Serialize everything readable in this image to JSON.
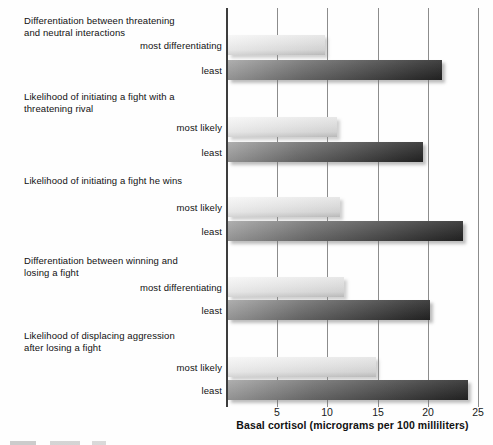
{
  "chart_data": {
    "type": "bar",
    "orientation": "horizontal",
    "title": "",
    "xlabel": "Basal cortisol (micrograms per 100 milliliters)",
    "ylabel": "",
    "xlim": [
      0,
      25
    ],
    "x_ticks": [
      5,
      10,
      15,
      20,
      25
    ],
    "gridlines": "vertical",
    "legend_position": "none",
    "bar_shade_meaning": {
      "light": "most (differentiating / likely)",
      "dark": "least"
    },
    "groups": [
      {
        "id": "a.",
        "label": "Differentiation between threatening and neutral interactions",
        "label_lines": [
          "Differentiation between threatening",
          "and neutral interactions"
        ],
        "bars": [
          {
            "label": "most differentiating",
            "value": 9.8,
            "shade": "light"
          },
          {
            "label": "least",
            "value": 21.4,
            "shade": "dark"
          }
        ]
      },
      {
        "id": "b.",
        "label": "Likelihood of initiating a fight with a threatening rival",
        "label_lines": [
          "Likelihood of initiating a fight with a",
          "threatening rival"
        ],
        "bars": [
          {
            "label": "most likely",
            "value": 11.0,
            "shade": "light"
          },
          {
            "label": "least",
            "value": 19.5,
            "shade": "dark"
          }
        ]
      },
      {
        "id": "c.",
        "label": "Likelihood of initiating a fight he wins",
        "label_lines": [
          "Likelihood of initiating a fight he wins"
        ],
        "bars": [
          {
            "label": "most likely",
            "value": 11.3,
            "shade": "light"
          },
          {
            "label": "least",
            "value": 23.5,
            "shade": "dark"
          }
        ]
      },
      {
        "id": "d.",
        "label": "Differentiation between winning and losing a fight",
        "label_lines": [
          "Differentiation between winning and",
          "losing a fight"
        ],
        "bars": [
          {
            "label": "most differentiating",
            "value": 11.7,
            "shade": "light"
          },
          {
            "label": "least",
            "value": 20.2,
            "shade": "dark"
          }
        ]
      },
      {
        "id": "e.",
        "label": "Likelihood of displacing aggression after losing a fight",
        "label_lines": [
          "Likelihood of displacing aggression",
          "after losing a fight"
        ],
        "bars": [
          {
            "label": "most likely",
            "value": 14.8,
            "shade": "light"
          },
          {
            "label": "least",
            "value": 24.0,
            "shade": "dark"
          }
        ]
      }
    ],
    "colors": {
      "light_bar": "#e4e4e4",
      "dark_bar_start": "#a2a2a2",
      "dark_bar_end": "#262626",
      "gridline": "#8c8c8c",
      "text": "#111111",
      "background": "#fefefe"
    }
  }
}
